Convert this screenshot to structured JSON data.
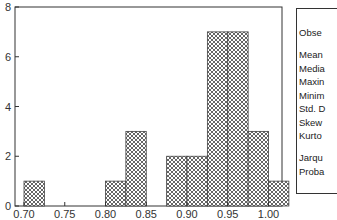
{
  "chart_data": {
    "type": "bar",
    "subtype": "histogram",
    "title": "",
    "xlabel": "",
    "ylabel": "",
    "xlim": [
      0.69,
      1.04
    ],
    "ylim": [
      0,
      8
    ],
    "x_ticks": [
      "0.70",
      "0.75",
      "0.80",
      "0.85",
      "0.90",
      "0.95",
      "1.00"
    ],
    "y_ticks": [
      "0",
      "2",
      "4",
      "6",
      "8"
    ],
    "bin_width": 0.025,
    "bins": [
      {
        "start": 0.7,
        "end": 0.725,
        "count": 1
      },
      {
        "start": 0.8,
        "end": 0.825,
        "count": 1
      },
      {
        "start": 0.825,
        "end": 0.85,
        "count": 3
      },
      {
        "start": 0.875,
        "end": 0.9,
        "count": 2
      },
      {
        "start": 0.9,
        "end": 0.925,
        "count": 2
      },
      {
        "start": 0.925,
        "end": 0.95,
        "count": 7
      },
      {
        "start": 0.95,
        "end": 0.975,
        "count": 7
      },
      {
        "start": 0.975,
        "end": 1.0,
        "count": 3
      },
      {
        "start": 1.0,
        "end": 1.025,
        "count": 1
      }
    ],
    "categories": [
      "0.700-0.725",
      "0.800-0.825",
      "0.825-0.850",
      "0.875-0.900",
      "0.900-0.925",
      "0.925-0.950",
      "0.950-0.975",
      "0.975-1.000",
      "1.000-1.025"
    ],
    "values": [
      1,
      1,
      3,
      2,
      2,
      7,
      7,
      3,
      1
    ],
    "fill_pattern": "crosshatch",
    "grid": false,
    "legend": "none"
  },
  "stats_panel": {
    "rows": [
      {
        "label": "Obse",
        "gap_after": true
      },
      {
        "label": "Mean"
      },
      {
        "label": "Media"
      },
      {
        "label": "Maxin"
      },
      {
        "label": "Minim"
      },
      {
        "label": "Std. D"
      },
      {
        "label": "Skew"
      },
      {
        "label": "Kurto",
        "gap_after": true
      },
      {
        "label": "Jarqu"
      },
      {
        "label": "Proba"
      }
    ]
  },
  "colors": {
    "axis": "#333333",
    "bar_outline": "#444444",
    "hatch": "#555555",
    "background": "#ffffff"
  }
}
